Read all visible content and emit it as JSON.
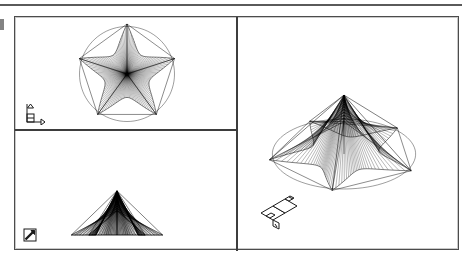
{
  "document": {
    "title": "CAD viewport layout",
    "background_color": "#ffffff",
    "line_color": "#000000",
    "frame_border_color": "#4c4c4c",
    "separator_color": "#3d3d3d"
  },
  "page": {
    "top_rule": {
      "name": "top-rule",
      "visible": true
    },
    "margin_mark": {
      "name": "margin-mark",
      "visible": true
    }
  },
  "viewports": [
    {
      "id": "top-left",
      "name": "Top view",
      "projection": "plan",
      "ucs_icon": "ucs-2d-axis-icon",
      "ucs_icon_label": "2D XY axis marker",
      "model": "star-tent-mesh",
      "model_view": "top",
      "outline": "pentagon-and-circle"
    },
    {
      "id": "bottom-left",
      "name": "Front view",
      "projection": "elevation",
      "ucs_icon": "ucs-broken-pencil-icon",
      "ucs_icon_label": "broken pencil marker",
      "model": "star-tent-mesh",
      "model_view": "front",
      "outline": "trapezoid"
    },
    {
      "id": "right",
      "name": "Isometric view",
      "projection": "isometric",
      "ucs_icon": "ucs-3d-axis-icon",
      "ucs_icon_label": "3D isometric axis marker",
      "model": "star-tent-mesh",
      "model_view": "southwest-isometric",
      "outline": "pentagon-and-circle"
    }
  ],
  "chart_data": {
    "type": "scatter",
    "geometry": {
      "points": 5,
      "outer_radius": 1.0,
      "peak_height": 1.0,
      "valley_height": 0.0,
      "mesh_lines_per_panel": 26,
      "base_circle_radius": 0.95
    },
    "xlabel": "",
    "ylabel": "",
    "legend": []
  }
}
